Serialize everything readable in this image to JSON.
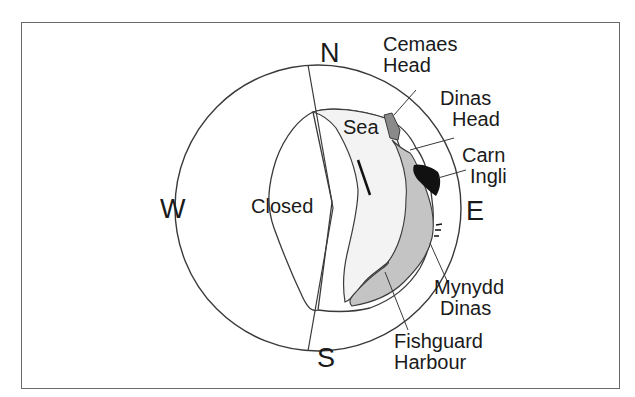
{
  "diagram": {
    "compass": {
      "north": "N",
      "south": "S",
      "east": "E",
      "west": "W"
    },
    "regions": {
      "closed": "Closed",
      "sea": "Sea"
    },
    "places": {
      "cemaes_head": {
        "line1": "Cemaes",
        "line2": "Head"
      },
      "dinas_head": {
        "line1": "Dinas",
        "line2": "Head"
      },
      "carn_ingli": {
        "line1": "Carn",
        "line2": "Ingli"
      },
      "mynydd_dinas": {
        "line1": "Mynydd",
        "line2": "Dinas"
      },
      "fishguard_harbour": {
        "line1": "Fishguard",
        "line2": "Harbour"
      }
    },
    "colors": {
      "outline": "#3a3a3a",
      "light_fill": "#f2f2f2",
      "medium_fill": "#c4c4c4",
      "dark_gray_fill": "#8a8a8a",
      "black_fill": "#111111",
      "frame": "#6a6a6a"
    }
  }
}
